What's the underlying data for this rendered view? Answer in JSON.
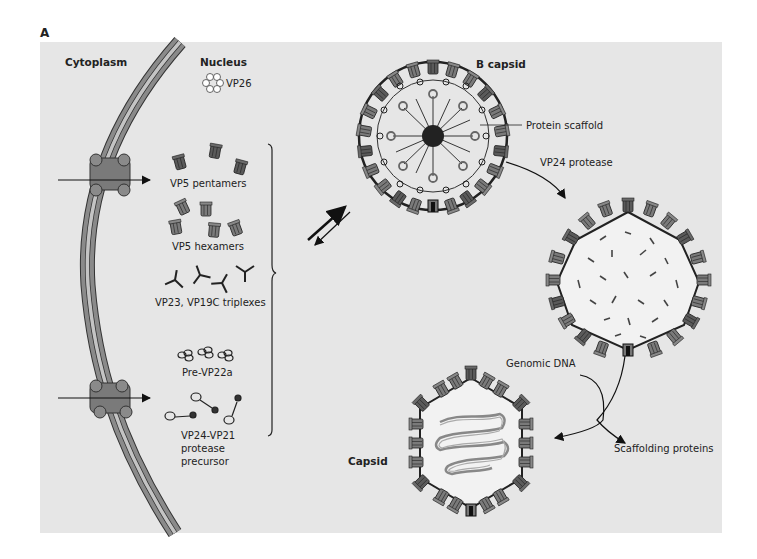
{
  "figure": {
    "panel_letter": "A",
    "background_color": "#e6e6e6",
    "membrane_color": "#8a8a8a",
    "membrane_inner_color": "#bdbdbd",
    "capsomer_color": "#555555"
  },
  "compartments": {
    "cytoplasm": "Cytoplasm",
    "nucleus": "Nucleus"
  },
  "components": {
    "vp26": "VP26",
    "vp5_pentamers": "VP5 pentamers",
    "vp5_hexamers": "VP5 hexamers",
    "triplexes": "VP23, VP19C triplexes",
    "pre_vp22a": "Pre-VP22a",
    "protease_precursor_line1": "VP24-VP21",
    "protease_precursor_line2": "protease",
    "protease_precursor_line3": "precursor"
  },
  "stages": {
    "b_capsid": "B capsid",
    "protein_scaffold": "Protein scaffold",
    "vp24_protease": "VP24 protease",
    "genomic_dna": "Genomic DNA",
    "scaffolding_proteins": "Scaffolding proteins",
    "capsid": "Capsid"
  }
}
